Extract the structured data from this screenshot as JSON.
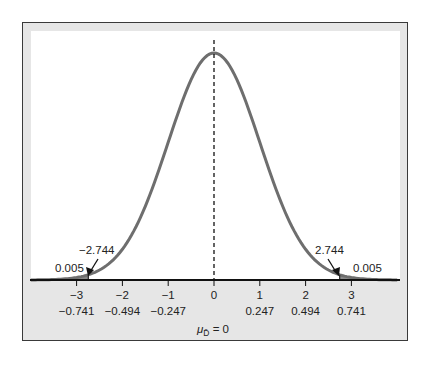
{
  "chart_data": {
    "type": "line",
    "title": "",
    "xlabel": "μ_D̄ = 0",
    "ylabel": "",
    "x_ticks_standardized": [
      "-3",
      "-2",
      "-1",
      "0",
      "1",
      "2",
      "3"
    ],
    "x_ticks_raw": [
      "-0.741",
      "-0.494",
      "-0.247",
      "",
      "0.247",
      "0.494",
      "0.741"
    ],
    "x_tick_values": [
      -3,
      -2,
      -1,
      0,
      1,
      2,
      3
    ],
    "raw_values": [
      -0.741,
      -0.494,
      -0.247,
      0,
      0.247,
      0.494,
      0.741
    ],
    "xlim": [
      -4,
      4
    ],
    "mean_line": {
      "x": 0,
      "style": "dashed"
    },
    "critical_values": [
      {
        "x": -2.744,
        "label": "-2.744",
        "tail_area": 0.005,
        "tail_label": "0.005"
      },
      {
        "x": 2.744,
        "label": "2.744",
        "tail_area": 0.005,
        "tail_label": "0.005"
      }
    ],
    "curve": {
      "distribution": "normal",
      "mean": 0,
      "sd": 1,
      "color": "#6e6e6e"
    },
    "shading_color": "#8a8a8a",
    "grid": false,
    "legend": null
  },
  "labels": {
    "crit_left": "−2.744",
    "crit_right": "2.744",
    "tail_left": "0.005",
    "tail_right": "0.005",
    "tick_z": [
      "−3",
      "−2",
      "−1",
      "0",
      "1",
      "2",
      "3"
    ],
    "tick_raw": [
      "−0.741",
      "−0.494",
      "−0.247",
      "0.247",
      "0.494",
      "0.741"
    ],
    "mean_label_mu": "μ",
    "mean_label_sub": "D̄",
    "mean_label_rest": " = 0"
  }
}
